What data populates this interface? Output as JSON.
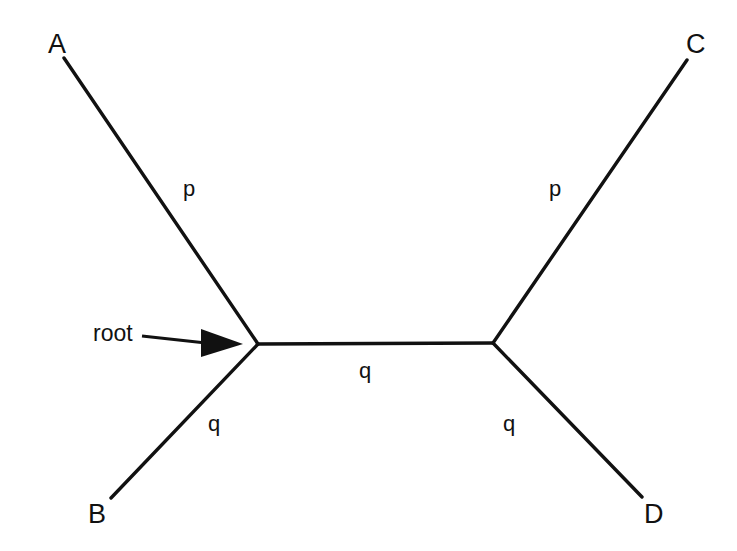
{
  "figure": {
    "type": "unrooted-phylogenetic-tree",
    "background_color": "#ffffff",
    "line_color": "#111111",
    "line_width": 3
  },
  "taxa": [
    {
      "name": "A",
      "label": "A",
      "label_x": 48,
      "label_y": 31,
      "tip_x": 64,
      "tip_y": 58
    },
    {
      "name": "B",
      "label": "B",
      "label_x": 88,
      "label_y": 501,
      "tip_x": 111,
      "tip_y": 498
    },
    {
      "name": "C",
      "label": "C",
      "label_x": 686,
      "label_y": 31,
      "tip_x": 687,
      "tip_y": 60
    },
    {
      "name": "D",
      "label": "D",
      "label_x": 644,
      "label_y": 501,
      "tip_x": 642,
      "tip_y": 497
    }
  ],
  "nodes": [
    {
      "name": "left-internal-node",
      "x": 258,
      "y": 344
    },
    {
      "name": "right-internal-node",
      "x": 493,
      "y": 343
    }
  ],
  "branch_labels": [
    {
      "name": "branch-label-a",
      "text": "p",
      "x": 183,
      "y": 178,
      "branch": "A-to-left-node"
    },
    {
      "name": "branch-label-b",
      "text": "q",
      "x": 208,
      "y": 413,
      "branch": "B-to-left-node"
    },
    {
      "name": "branch-label-c",
      "text": "p",
      "x": 549,
      "y": 178,
      "branch": "C-to-right-node"
    },
    {
      "name": "branch-label-d",
      "text": "q",
      "x": 503,
      "y": 413,
      "branch": "D-to-right-node"
    },
    {
      "name": "branch-label-internal",
      "text": "q",
      "x": 359,
      "y": 360,
      "branch": "left-node-to-right-node"
    }
  ],
  "annotation": {
    "root": {
      "label": "root",
      "label_x": 93,
      "label_y": 322,
      "arrow": {
        "shaft_start_x": 142,
        "shaft_start_y": 336,
        "shaft_end_x": 203,
        "shaft_end_y": 343,
        "tip_x": 243,
        "tip_y": 344,
        "head_base_x": 201,
        "head_top_y": 329,
        "head_bottom_y": 357
      }
    }
  }
}
